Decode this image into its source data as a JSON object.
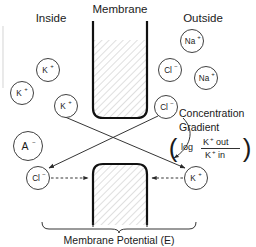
{
  "figure": {
    "title_inside": "Inside",
    "title_membrane": "Membrane",
    "title_outside": "Outside",
    "caption": "Membrane Potential (E)",
    "note_line1": "Concentration",
    "note_line2": "Gradient",
    "formula": {
      "paren_open": "(",
      "paren_close": ")",
      "log": "log",
      "numerator_ion": "K",
      "numerator_charge": "+",
      "numerator_word": "out",
      "denominator_ion": "K",
      "denominator_charge": "+",
      "denominator_word": "in"
    }
  },
  "colors": {
    "ink": "#1a1a1a",
    "membrane_stroke": "#111111",
    "hatch": "#8a8a8a",
    "background": "#ffffff",
    "page_edge": "#d8d8d8"
  },
  "ions": {
    "inside_top": [
      {
        "name": "potassium-ion",
        "symbol": "K",
        "charge": "+",
        "cx": 48,
        "cy": 70,
        "r": 11.5
      },
      {
        "name": "potassium-ion",
        "symbol": "K",
        "charge": "+",
        "cx": 22,
        "cy": 93,
        "r": 11.5
      },
      {
        "name": "potassium-ion",
        "symbol": "K",
        "charge": "+",
        "cx": 66,
        "cy": 106,
        "r": 11.5
      }
    ],
    "outside_top": [
      {
        "name": "sodium-ion",
        "symbol": "Na",
        "charge": "+",
        "cx": 192,
        "cy": 41,
        "r": 11.5
      },
      {
        "name": "chloride-ion",
        "symbol": "Cl",
        "charge": "−",
        "cx": 170,
        "cy": 70,
        "r": 11.5
      },
      {
        "name": "sodium-ion",
        "symbol": "Na",
        "charge": "+",
        "cx": 206,
        "cy": 78,
        "r": 11.5
      }
    ],
    "inside_lower": [
      {
        "name": "anion",
        "symbol": "A",
        "charge": "−",
        "cx": 28,
        "cy": 146,
        "r": 14.5
      }
    ],
    "gradient_source": [
      {
        "name": "chloride-ion",
        "symbol": "Cl",
        "charge": "−",
        "cx": 166,
        "cy": 107,
        "r": 11.5
      }
    ],
    "bottom_row": [
      {
        "name": "chloride-ion",
        "symbol": "Cl",
        "charge": "−",
        "cx": 38,
        "cy": 178,
        "r": 11.5
      },
      {
        "name": "potassium-ion",
        "symbol": "K",
        "charge": "+",
        "cx": 196,
        "cy": 178,
        "r": 11.5
      }
    ]
  },
  "membranes": {
    "top": {
      "name": "membrane-upper",
      "x": 92,
      "y": 21,
      "w": 56,
      "h": 98
    },
    "bottom": {
      "name": "membrane-lower",
      "x": 92,
      "y": 163,
      "w": 56,
      "h": 62
    }
  },
  "arrows": {
    "k_transport": {
      "from_x": 58,
      "from_y": 114,
      "to_x": 187,
      "to_y": 169
    },
    "cl_transport": {
      "from_x": 158,
      "from_y": 116,
      "to_x": 47,
      "to_y": 168
    },
    "cl_dashed": {
      "from_x": 51,
      "from_y": 178,
      "to_x": 89,
      "to_y": 178
    },
    "k_dashed": {
      "from_x": 183,
      "from_y": 178,
      "to_x": 151,
      "to_y": 178
    },
    "gradient_pointer": {
      "from_x": 181,
      "from_y": 120,
      "to_x": 170,
      "to_y": 160
    }
  }
}
